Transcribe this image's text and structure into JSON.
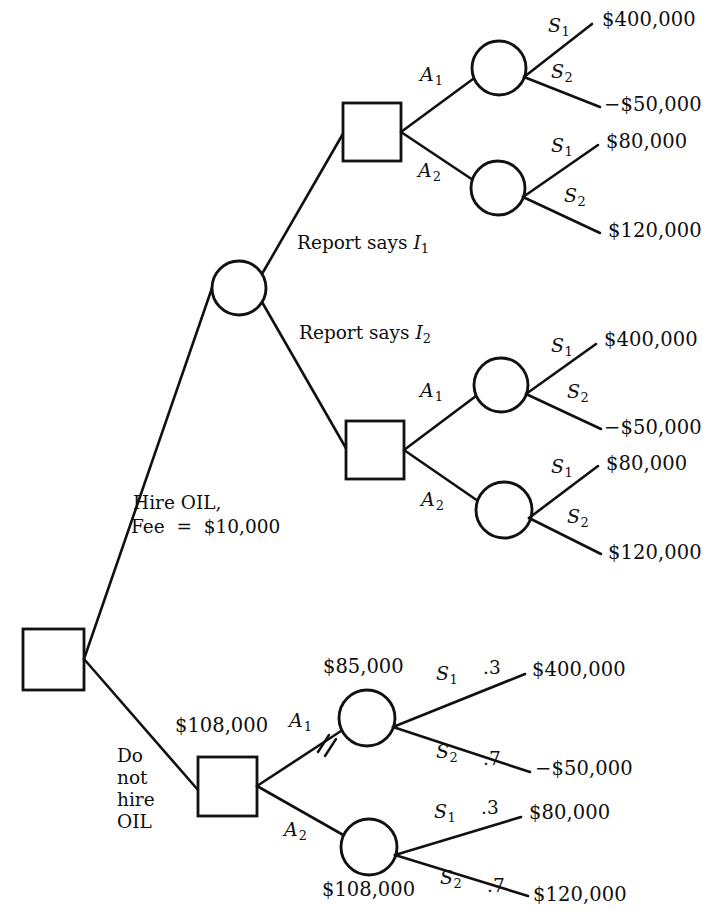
{
  "diagram": {
    "type": "decision-tree",
    "line_color": "#111111",
    "background": "#ffffff"
  },
  "root": {
    "branches": {
      "hire_line1": "Hire OIL,",
      "hire_line2": "Fee  =  $10,000",
      "no_hire_line1": "Do",
      "no_hire_line2": "not",
      "no_hire_line3": "hire",
      "no_hire_line4": "OIL"
    }
  },
  "report_branches": {
    "i1": {
      "prefix": "Report says ",
      "symbol": "I",
      "subscript": "1"
    },
    "i2": {
      "prefix": "Report says ",
      "symbol": "I",
      "subscript": "2"
    }
  },
  "actions": {
    "a1": {
      "symbol": "A",
      "subscript": "1"
    },
    "a2": {
      "symbol": "A",
      "subscript": "2"
    }
  },
  "states": {
    "s1": {
      "symbol": "S",
      "subscript": "1"
    },
    "s2": {
      "symbol": "S",
      "subscript": "2"
    }
  },
  "probabilities": {
    "s1": ".3",
    "s2": ".7"
  },
  "payoffs": {
    "a1_s1": "$400,000",
    "a1_s2": "−$50,000",
    "a2_s1": "$80,000",
    "a2_s2": "$120,000"
  },
  "expected_values": {
    "no_hire_decision": "$108,000",
    "a1_chance": "$85,000",
    "a2_chance": "$108,000"
  },
  "subtrees": [
    {
      "id": "i1-subtree",
      "label": "Report says I1 subtree",
      "actions": [
        {
          "action": "A1",
          "state_payoffs": [
            "$400,000",
            "−$50,000"
          ]
        },
        {
          "action": "A2",
          "state_payoffs": [
            "$80,000",
            "$120,000"
          ]
        }
      ]
    },
    {
      "id": "i2-subtree",
      "label": "Report says I2 subtree",
      "actions": [
        {
          "action": "A1",
          "state_payoffs": [
            "$400,000",
            "−$50,000"
          ]
        },
        {
          "action": "A2",
          "state_payoffs": [
            "$80,000",
            "$120,000"
          ]
        }
      ]
    },
    {
      "id": "no-hire-subtree",
      "label": "Do not hire OIL subtree",
      "actions": [
        {
          "action": "A1",
          "state_payoffs": [
            "$400,000",
            "−$50,000"
          ],
          "ev": "$85,000",
          "pruned": true
        },
        {
          "action": "A2",
          "state_payoffs": [
            "$80,000",
            "$120,000"
          ],
          "ev": "$108,000",
          "pruned": false
        }
      ]
    }
  ]
}
